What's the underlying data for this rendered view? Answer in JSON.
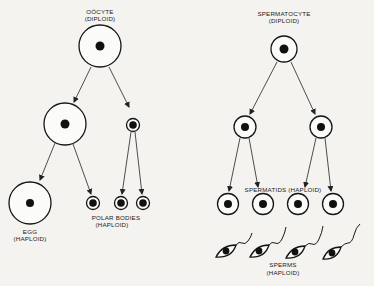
{
  "oogenesis": {
    "oocyte_label": "OÖCYTE",
    "oocyte_ploidy": "(DIPLOID)",
    "egg_label": "EGG",
    "egg_ploidy": "(HAPLOID)",
    "polar_bodies_label": "POLAR  BODIES",
    "polar_bodies_ploidy": "(HAPLOID)"
  },
  "spermatogenesis": {
    "spermatocyte_label": "SPERMATOCYTE",
    "spermatocyte_ploidy": "(DIPLOID)",
    "spermatids_label": "SPERMATIDS  (HAPLOID)",
    "sperms_label": "SPERMS",
    "sperms_ploidy": "(HAPLOID)"
  }
}
